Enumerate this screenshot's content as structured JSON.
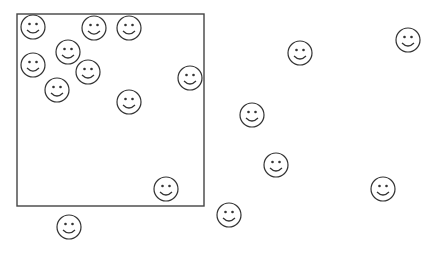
{
  "canvas": {
    "width": 436,
    "height": 261,
    "background": "#ffffff"
  },
  "colors": {
    "stroke": "#333333",
    "box": "#444444"
  },
  "box": {
    "x": 17,
    "y": 14,
    "width": 187,
    "height": 192
  },
  "smiley_radius": 12,
  "smileys": [
    {
      "x": 33,
      "y": 27,
      "inside_box": true
    },
    {
      "x": 94,
      "y": 28,
      "inside_box": true
    },
    {
      "x": 129,
      "y": 28,
      "inside_box": true
    },
    {
      "x": 68,
      "y": 52,
      "inside_box": true
    },
    {
      "x": 33,
      "y": 65,
      "inside_box": true
    },
    {
      "x": 88,
      "y": 72,
      "inside_box": true
    },
    {
      "x": 190,
      "y": 78,
      "inside_box": true
    },
    {
      "x": 57,
      "y": 90,
      "inside_box": true
    },
    {
      "x": 129,
      "y": 102,
      "inside_box": true
    },
    {
      "x": 166,
      "y": 189,
      "inside_box": true
    },
    {
      "x": 69,
      "y": 227,
      "inside_box": false
    },
    {
      "x": 300,
      "y": 53,
      "inside_box": false
    },
    {
      "x": 408,
      "y": 40,
      "inside_box": false
    },
    {
      "x": 252,
      "y": 115,
      "inside_box": false
    },
    {
      "x": 276,
      "y": 165,
      "inside_box": false
    },
    {
      "x": 383,
      "y": 189,
      "inside_box": false
    },
    {
      "x": 229,
      "y": 215,
      "inside_box": false
    }
  ],
  "counts": {
    "total": 17,
    "inside_box": 10,
    "outside_box": 7
  }
}
